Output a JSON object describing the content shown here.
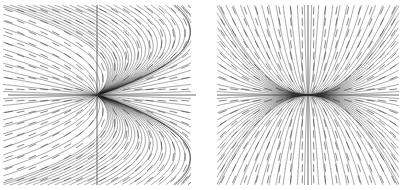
{
  "chart_data": [
    {
      "type": "vector-field",
      "title": "",
      "xlabel": "",
      "ylabel": "",
      "description": "Phase portrait (direction field with streamlines); trajectories converge to origin from the left along a parabolic boundary and fan out to the right.",
      "xlim": [
        -2,
        2
      ],
      "ylim": [
        -2,
        2
      ],
      "grid": false,
      "axes_through_origin": true,
      "field": {
        "dx": "y*y - x",
        "dy": "-y",
        "note": "qualitative approximation"
      },
      "stroke_color": "#222222",
      "arrow_color": "#555555"
    },
    {
      "type": "vector-field",
      "title": "",
      "xlabel": "",
      "ylabel": "",
      "description": "Phase portrait (direction field with streamlines); node at the origin with trajectories tangent to the vertical axis.",
      "xlim": [
        -2,
        2
      ],
      "ylim": [
        -2,
        2
      ],
      "grid": false,
      "axes_through_origin": true,
      "field": {
        "dx": "x",
        "dy": "2*y",
        "note": "qualitative approximation"
      },
      "stroke_color": "#222222",
      "arrow_color": "#555555"
    }
  ]
}
